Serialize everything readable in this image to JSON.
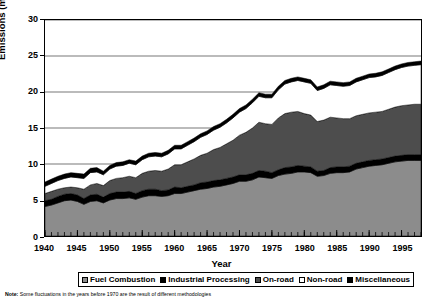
{
  "axes": {
    "y_title": "Emissions (million short tons)",
    "x_title": "Year",
    "y_ticks": [
      "0",
      "5",
      "10",
      "15",
      "20",
      "25",
      "30"
    ],
    "x_ticks": [
      "1940",
      "1945",
      "1950",
      "1955",
      "1960",
      "1965",
      "1970",
      "1975",
      "1980",
      "1985",
      "1990",
      "1995"
    ]
  },
  "legend": {
    "items": [
      {
        "label": "Fuel Combustion",
        "color": "#8c8c8c"
      },
      {
        "label": "Industrial Processing",
        "color": "#000000"
      },
      {
        "label": "On-road",
        "color": "#4d4d4d"
      },
      {
        "label": "Non-road",
        "color": "#ffffff"
      },
      {
        "label": "Miscellaneous",
        "color": "#000000"
      }
    ]
  },
  "note": {
    "prefix": "Note:",
    "text": "Some fluctuations in the years before 1970 are the result of different methodologies"
  },
  "chart_data": {
    "type": "area",
    "title": "",
    "subtitle": "",
    "xlabel": "Year",
    "ylabel": "Emissions (million short tons)",
    "xlim": [
      1940,
      1998
    ],
    "ylim": [
      0,
      30
    ],
    "grid": true,
    "stacked": true,
    "legend_position": "bottom",
    "x": [
      1940,
      1941,
      1942,
      1943,
      1944,
      1945,
      1946,
      1947,
      1948,
      1949,
      1950,
      1951,
      1952,
      1953,
      1954,
      1955,
      1956,
      1957,
      1958,
      1959,
      1960,
      1961,
      1962,
      1963,
      1964,
      1965,
      1966,
      1967,
      1968,
      1969,
      1970,
      1971,
      1972,
      1973,
      1974,
      1975,
      1976,
      1977,
      1978,
      1979,
      1980,
      1981,
      1982,
      1983,
      1984,
      1985,
      1986,
      1987,
      1988,
      1989,
      1990,
      1991,
      1992,
      1993,
      1994,
      1995,
      1996,
      1997,
      1998
    ],
    "series": [
      {
        "name": "Fuel Combustion",
        "color": "#8c8c8c",
        "values": [
          4.1,
          4.3,
          4.6,
          4.9,
          5.0,
          4.8,
          4.4,
          4.8,
          4.9,
          4.6,
          5.0,
          5.2,
          5.2,
          5.3,
          5.1,
          5.4,
          5.6,
          5.6,
          5.5,
          5.6,
          5.9,
          5.9,
          6.1,
          6.3,
          6.5,
          6.6,
          6.8,
          6.9,
          7.1,
          7.3,
          7.6,
          7.6,
          7.8,
          8.2,
          8.1,
          8.0,
          8.4,
          8.6,
          8.7,
          8.9,
          8.9,
          8.8,
          8.3,
          8.4,
          8.7,
          8.8,
          8.8,
          8.9,
          9.3,
          9.5,
          9.7,
          9.8,
          9.9,
          10.1,
          10.3,
          10.4,
          10.5,
          10.5,
          10.5
        ]
      },
      {
        "name": "Industrial Processing",
        "color": "#000000",
        "values": [
          0.8,
          0.8,
          0.9,
          0.9,
          0.9,
          0.9,
          0.8,
          0.9,
          0.9,
          0.8,
          0.9,
          0.9,
          0.9,
          0.9,
          0.8,
          0.9,
          0.9,
          0.9,
          0.8,
          0.8,
          0.9,
          0.8,
          0.8,
          0.8,
          0.9,
          0.9,
          0.9,
          0.9,
          0.9,
          0.9,
          0.9,
          0.9,
          0.9,
          0.9,
          0.9,
          0.8,
          0.8,
          0.9,
          0.9,
          0.9,
          0.8,
          0.8,
          0.7,
          0.7,
          0.8,
          0.8,
          0.8,
          0.8,
          0.8,
          0.8,
          0.8,
          0.8,
          0.8,
          0.8,
          0.8,
          0.8,
          0.8,
          0.8,
          0.8
        ]
      },
      {
        "name": "On-road",
        "color": "#4d4d4d",
        "values": [
          1.0,
          1.1,
          1.0,
          0.9,
          0.9,
          1.0,
          1.3,
          1.4,
          1.5,
          1.6,
          1.8,
          1.9,
          2.0,
          2.1,
          2.2,
          2.4,
          2.5,
          2.6,
          2.7,
          2.9,
          3.1,
          3.2,
          3.4,
          3.6,
          3.8,
          4.0,
          4.3,
          4.5,
          4.8,
          5.1,
          5.5,
          5.9,
          6.3,
          6.7,
          6.6,
          6.7,
          7.2,
          7.5,
          7.6,
          7.5,
          7.3,
          7.2,
          6.9,
          7.0,
          7.0,
          6.8,
          6.7,
          6.6,
          6.6,
          6.6,
          6.6,
          6.6,
          6.6,
          6.7,
          6.8,
          6.9,
          6.9,
          7.0,
          7.0
        ]
      },
      {
        "name": "Non-road",
        "color": "#ffffff",
        "values": [
          1.0,
          1.1,
          1.2,
          1.3,
          1.4,
          1.4,
          1.5,
          1.7,
          1.6,
          1.5,
          1.6,
          1.7,
          1.7,
          1.8,
          1.8,
          1.9,
          2.0,
          2.0,
          2.0,
          2.1,
          2.2,
          2.2,
          2.3,
          2.4,
          2.5,
          2.6,
          2.7,
          2.8,
          2.9,
          3.1,
          3.2,
          3.3,
          3.5,
          3.6,
          3.6,
          3.7,
          3.9,
          4.1,
          4.2,
          4.3,
          4.4,
          4.4,
          4.3,
          4.4,
          4.5,
          4.5,
          4.5,
          4.6,
          4.7,
          4.8,
          4.9,
          4.9,
          5.0,
          5.1,
          5.2,
          5.3,
          5.4,
          5.4,
          5.5
        ]
      },
      {
        "name": "Miscellaneous",
        "color": "#000000",
        "values": [
          0.6,
          0.6,
          0.6,
          0.6,
          0.6,
          0.6,
          0.6,
          0.6,
          0.6,
          0.5,
          0.5,
          0.5,
          0.5,
          0.5,
          0.5,
          0.5,
          0.5,
          0.5,
          0.5,
          0.5,
          0.5,
          0.5,
          0.5,
          0.5,
          0.5,
          0.5,
          0.5,
          0.5,
          0.5,
          0.5,
          0.5,
          0.5,
          0.5,
          0.5,
          0.5,
          0.5,
          0.5,
          0.5,
          0.5,
          0.5,
          0.5,
          0.5,
          0.5,
          0.5,
          0.5,
          0.5,
          0.5,
          0.5,
          0.5,
          0.5,
          0.5,
          0.5,
          0.5,
          0.5,
          0.5,
          0.5,
          0.5,
          0.5,
          0.5
        ]
      }
    ],
    "totals_note": "Stacked total peaks near 25 in the late 1970s"
  }
}
